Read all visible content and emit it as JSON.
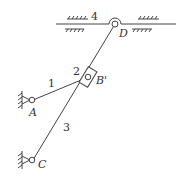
{
  "diagram": {
    "type": "mechanism-linkage",
    "links": [
      {
        "id": "1",
        "label": "1",
        "from": "A",
        "to": "B"
      },
      {
        "id": "2",
        "label": "2",
        "type": "slider",
        "at": "B"
      },
      {
        "id": "3",
        "label": "3",
        "from": "C",
        "to": "D"
      },
      {
        "id": "4",
        "label": "4",
        "type": "ground-slide-rail"
      }
    ],
    "joints": [
      {
        "id": "A",
        "label": "A",
        "type": "fixed-pivot"
      },
      {
        "id": "B",
        "label": "B'",
        "type": "slider-pivot"
      },
      {
        "id": "C",
        "label": "C",
        "type": "fixed-pivot"
      },
      {
        "id": "D",
        "label": "D",
        "type": "pivot-on-rail"
      }
    ],
    "colors": {
      "line": "#444444",
      "background": "#ffffff"
    }
  }
}
